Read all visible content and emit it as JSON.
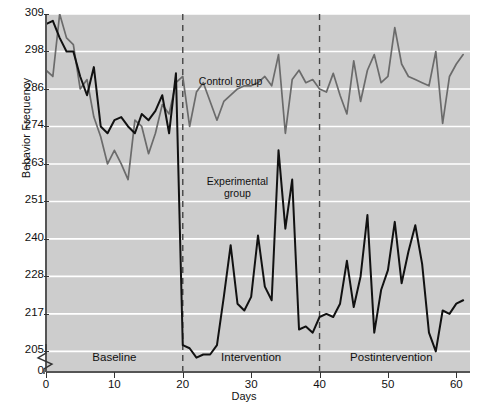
{
  "chart_data": {
    "type": "line",
    "title": "",
    "xlabel": "Days",
    "ylabel": "Behavior Frequency",
    "xlim": [
      0,
      62
    ],
    "ylim": [
      205,
      309
    ],
    "grid": true,
    "legend_position": "inline-annotations",
    "xticks": [
      0,
      10,
      20,
      30,
      40,
      50,
      60
    ],
    "yticks": [
      205,
      217,
      228,
      240,
      251,
      263,
      274,
      286,
      298,
      309
    ],
    "y_axis_break": true,
    "y_axis_break_label": "0",
    "annotations": [
      {
        "text": "Control group",
        "x": 27,
        "y": 288,
        "name": "control-group-label"
      },
      {
        "text": "Experimental group",
        "x": 28,
        "y": 257,
        "name": "experimental-group-label"
      }
    ],
    "phases": [
      {
        "label": "Baseline",
        "start": 0,
        "end": 20
      },
      {
        "label": "Intervention",
        "start": 20,
        "end": 40
      },
      {
        "label": "Postintervention",
        "start": 40,
        "end": 61
      }
    ],
    "phase_dividers": [
      20,
      40
    ],
    "series": [
      {
        "name": "Control group",
        "color": "#6b6b6b",
        "x": [
          0,
          1,
          2,
          3,
          4,
          5,
          6,
          7,
          8,
          9,
          10,
          11,
          12,
          13,
          14,
          15,
          16,
          17,
          18,
          19,
          20,
          21,
          22,
          23,
          24,
          25,
          26,
          27,
          28,
          29,
          30,
          31,
          32,
          33,
          34,
          35,
          36,
          37,
          38,
          39,
          40,
          41,
          42,
          43,
          44,
          45,
          46,
          47,
          48,
          49,
          50,
          51,
          52,
          53,
          54,
          55,
          56,
          57,
          58,
          59,
          60,
          61
        ],
        "values": [
          292,
          290,
          309,
          302,
          300,
          286,
          289,
          277,
          271,
          263,
          267,
          263,
          258,
          276,
          274,
          266,
          272,
          281,
          278,
          288,
          290,
          274,
          285,
          288,
          282,
          276,
          282,
          284,
          286,
          287,
          287,
          288,
          290,
          287,
          297,
          272,
          289,
          292,
          288,
          289,
          286,
          285,
          291,
          284,
          278,
          295,
          282,
          292,
          297,
          288,
          290,
          305,
          294,
          290,
          289,
          288,
          287,
          298,
          275,
          290,
          294,
          297
        ]
      },
      {
        "name": "Experimental group",
        "color": "#111111",
        "x": [
          0,
          1,
          2,
          3,
          4,
          5,
          6,
          7,
          8,
          9,
          10,
          11,
          12,
          13,
          14,
          15,
          16,
          17,
          18,
          19,
          20,
          21,
          22,
          23,
          24,
          25,
          26,
          27,
          28,
          29,
          30,
          31,
          32,
          33,
          34,
          35,
          36,
          37,
          38,
          39,
          40,
          41,
          42,
          43,
          44,
          45,
          46,
          47,
          48,
          49,
          50,
          51,
          52,
          53,
          54,
          55,
          56,
          57,
          58,
          59,
          60,
          61
        ],
        "values": [
          306,
          307,
          302,
          298,
          298,
          290,
          284,
          293,
          274,
          272,
          276,
          277,
          274,
          272,
          278,
          276,
          279,
          284,
          272,
          291,
          207,
          206,
          203,
          204,
          204,
          207,
          222,
          238,
          220,
          218,
          222,
          241,
          225,
          221,
          267,
          243,
          258,
          212,
          213,
          211,
          216,
          217,
          216,
          220,
          233,
          219,
          228,
          247,
          211,
          224,
          230,
          245,
          226,
          236,
          244,
          232,
          211,
          205,
          218,
          217,
          220,
          221
        ]
      }
    ]
  },
  "axis": {
    "y_break_zero": "0",
    "x_origin_zero": "0"
  }
}
